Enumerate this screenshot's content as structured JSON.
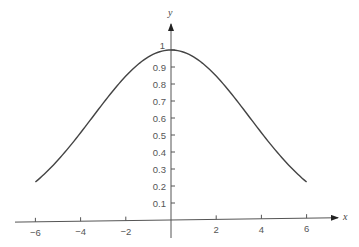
{
  "chart_data": {
    "type": "line",
    "title": "",
    "xlabel": "x",
    "ylabel": "y",
    "xlim": [
      -6,
      6
    ],
    "ylim": [
      0,
      1
    ],
    "grid": false,
    "legend": null,
    "x_ticks": [
      -6,
      -4,
      -2,
      2,
      4,
      6
    ],
    "x_tick_labels": [
      "−6",
      "−4",
      "−2",
      "2",
      "4",
      "6"
    ],
    "y_ticks": [
      0.1,
      0.2,
      0.3,
      0.4,
      0.5,
      0.6,
      0.7,
      0.8,
      0.9,
      1
    ],
    "y_tick_labels": [
      "0.1",
      "0.2",
      "0.3",
      "0.4",
      "0.5",
      "0.6",
      "0.7",
      "0.8",
      "0.9",
      "1"
    ],
    "series": [
      {
        "name": "bell curve",
        "x": [
          -6,
          -5,
          -4,
          -3,
          -2,
          -1,
          0,
          1,
          2,
          3,
          4,
          5,
          6
        ],
        "values": [
          0.22,
          0.35,
          0.51,
          0.69,
          0.85,
          0.96,
          1.0,
          0.96,
          0.85,
          0.69,
          0.51,
          0.35,
          0.22
        ]
      }
    ],
    "colors": {
      "curve": "#444444",
      "axes": "#555555"
    }
  }
}
